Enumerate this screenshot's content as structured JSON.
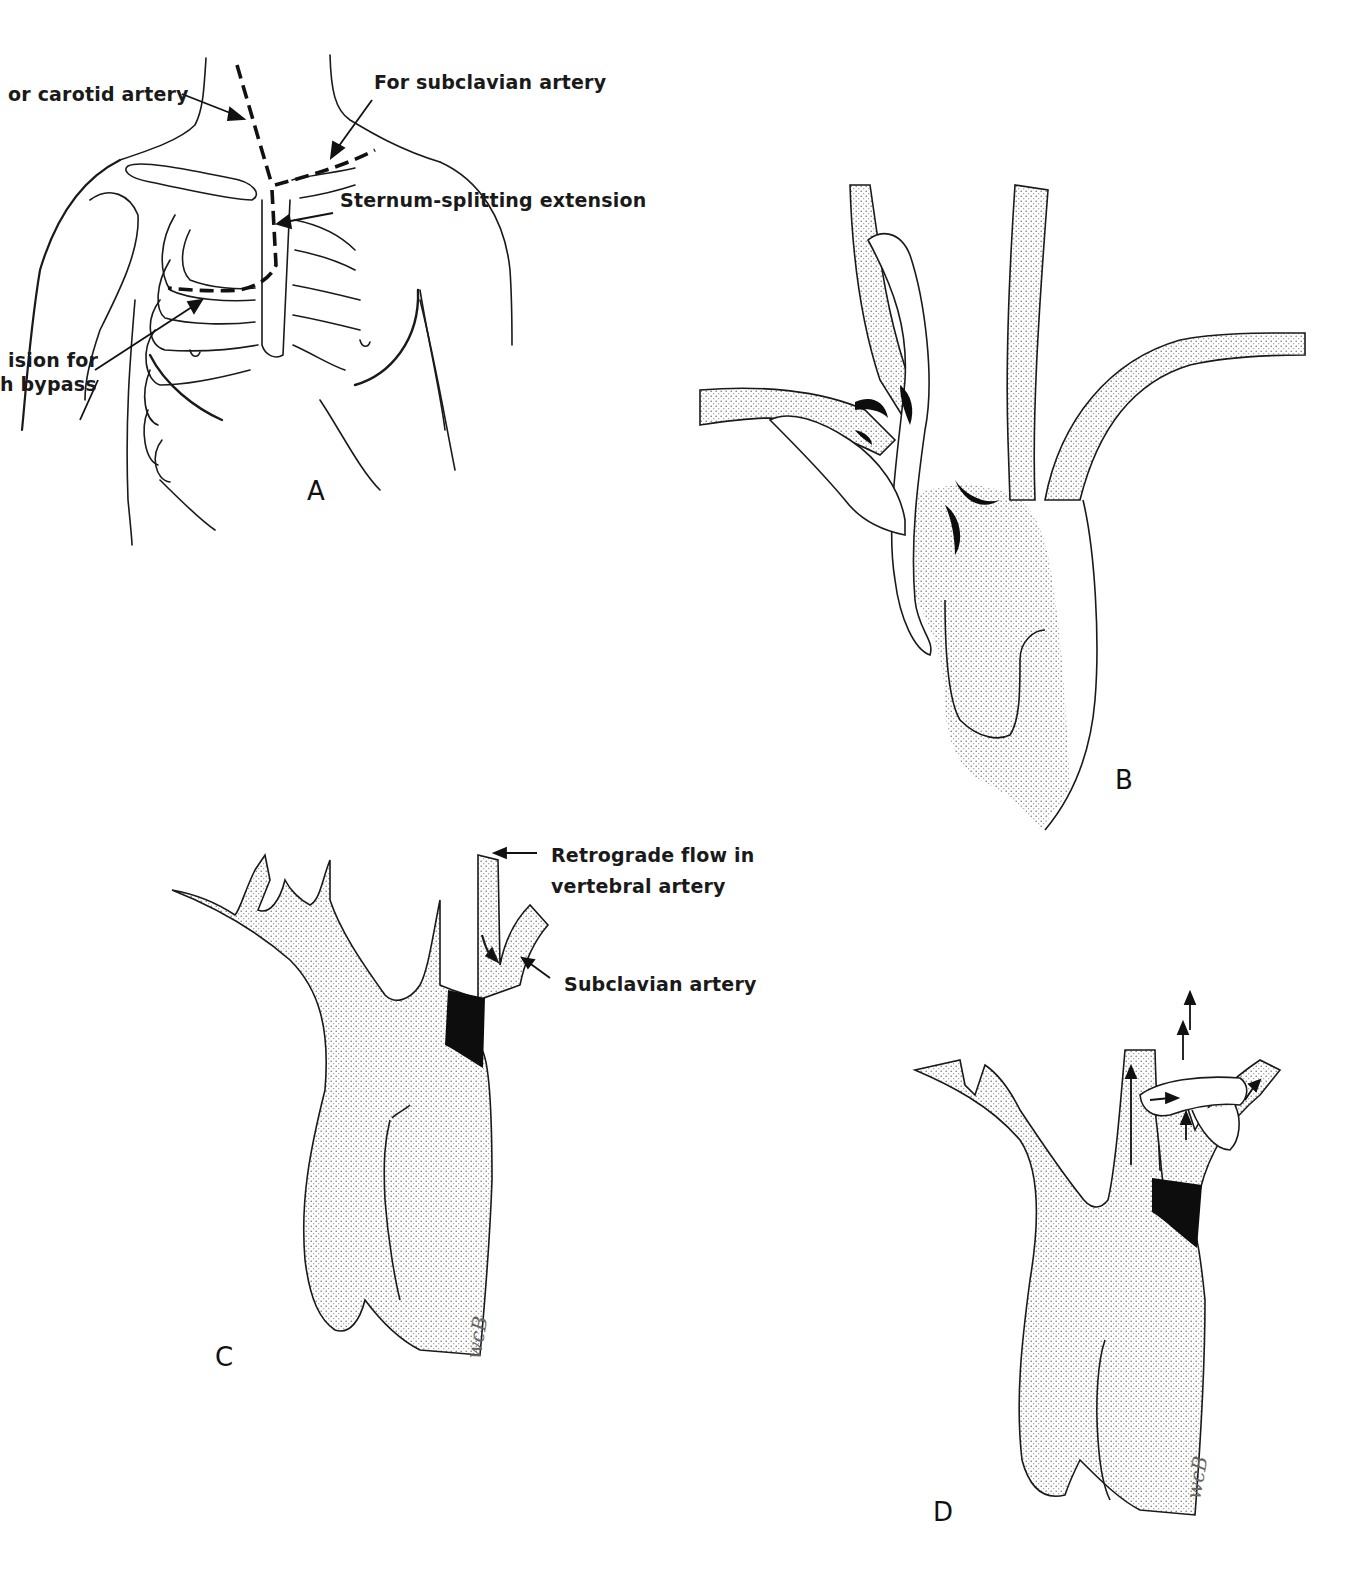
{
  "figure": {
    "panels": [
      {
        "id": "A",
        "letter": "A",
        "description": "Anterior chest with incision lines",
        "labels": {
          "carotid": "or carotid artery",
          "subclavian": "For subclavian artery",
          "sternum": "Sternum-splitting extension",
          "bypass_line1": "ision for",
          "bypass_line2": "h bypass"
        }
      },
      {
        "id": "B",
        "letter": "B",
        "description": "Aortic arch with bypass grafts"
      },
      {
        "id": "C",
        "letter": "C",
        "description": "Aortic arch with subclavian occlusion",
        "labels": {
          "retrograde_line1": "Retrograde flow in",
          "retrograde_line2": "vertebral artery",
          "subclavian": "Subclavian artery"
        },
        "signature": "WCB"
      },
      {
        "id": "D",
        "letter": "D",
        "description": "Aortic arch with carotid-subclavian bypass graft",
        "signature": "WCB"
      }
    ],
    "colors": {
      "ink": "#1a1a1a",
      "stipple": "#c9c9c9",
      "occlusion": "#0d0d0d",
      "background": "#ffffff"
    }
  }
}
